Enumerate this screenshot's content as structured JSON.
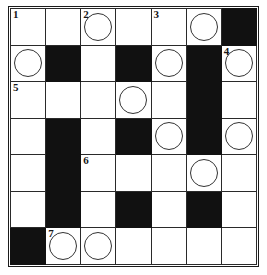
{
  "puzzle": {
    "type": "crossword-grid",
    "rows": 7,
    "columns": 7,
    "colors": {
      "block": "#111111",
      "cell": "#ffffff",
      "grid_line": "#2a2a2a",
      "frame": "#1b1b1b",
      "circle_stroke": "#333333",
      "number_text": "#161616"
    },
    "clue_numbers": [
      "1",
      "2",
      "3",
      "4",
      "5",
      "6",
      "7"
    ],
    "cells": [
      [
        {
          "block": false,
          "circle": false,
          "number": "1"
        },
        {
          "block": false,
          "circle": false,
          "number": ""
        },
        {
          "block": false,
          "circle": true,
          "number": "2"
        },
        {
          "block": false,
          "circle": false,
          "number": ""
        },
        {
          "block": false,
          "circle": false,
          "number": "3"
        },
        {
          "block": false,
          "circle": true,
          "number": ""
        },
        {
          "block": true,
          "circle": false,
          "number": ""
        }
      ],
      [
        {
          "block": false,
          "circle": true,
          "number": ""
        },
        {
          "block": true,
          "circle": false,
          "number": ""
        },
        {
          "block": false,
          "circle": false,
          "number": ""
        },
        {
          "block": true,
          "circle": false,
          "number": ""
        },
        {
          "block": false,
          "circle": true,
          "number": ""
        },
        {
          "block": true,
          "circle": false,
          "number": ""
        },
        {
          "block": false,
          "circle": true,
          "number": "4"
        }
      ],
      [
        {
          "block": false,
          "circle": false,
          "number": "5"
        },
        {
          "block": false,
          "circle": false,
          "number": ""
        },
        {
          "block": false,
          "circle": false,
          "number": ""
        },
        {
          "block": false,
          "circle": true,
          "number": ""
        },
        {
          "block": false,
          "circle": false,
          "number": ""
        },
        {
          "block": true,
          "circle": false,
          "number": ""
        },
        {
          "block": false,
          "circle": false,
          "number": ""
        }
      ],
      [
        {
          "block": false,
          "circle": false,
          "number": ""
        },
        {
          "block": true,
          "circle": false,
          "number": ""
        },
        {
          "block": false,
          "circle": false,
          "number": ""
        },
        {
          "block": true,
          "circle": false,
          "number": ""
        },
        {
          "block": false,
          "circle": true,
          "number": ""
        },
        {
          "block": true,
          "circle": false,
          "number": ""
        },
        {
          "block": false,
          "circle": true,
          "number": ""
        }
      ],
      [
        {
          "block": false,
          "circle": false,
          "number": ""
        },
        {
          "block": true,
          "circle": false,
          "number": ""
        },
        {
          "block": false,
          "circle": false,
          "number": "6"
        },
        {
          "block": false,
          "circle": false,
          "number": ""
        },
        {
          "block": false,
          "circle": false,
          "number": ""
        },
        {
          "block": false,
          "circle": true,
          "number": ""
        },
        {
          "block": false,
          "circle": false,
          "number": ""
        }
      ],
      [
        {
          "block": false,
          "circle": false,
          "number": ""
        },
        {
          "block": true,
          "circle": false,
          "number": ""
        },
        {
          "block": false,
          "circle": false,
          "number": ""
        },
        {
          "block": true,
          "circle": false,
          "number": ""
        },
        {
          "block": false,
          "circle": false,
          "number": ""
        },
        {
          "block": true,
          "circle": false,
          "number": ""
        },
        {
          "block": false,
          "circle": false,
          "number": ""
        }
      ],
      [
        {
          "block": true,
          "circle": false,
          "number": ""
        },
        {
          "block": false,
          "circle": true,
          "number": "7"
        },
        {
          "block": false,
          "circle": true,
          "number": ""
        },
        {
          "block": false,
          "circle": false,
          "number": ""
        },
        {
          "block": false,
          "circle": false,
          "number": ""
        },
        {
          "block": false,
          "circle": false,
          "number": ""
        },
        {
          "block": false,
          "circle": false,
          "number": ""
        }
      ]
    ]
  }
}
